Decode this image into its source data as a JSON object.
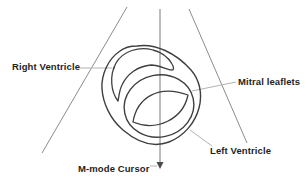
{
  "diagram": {
    "type": "echocardiography-schematic",
    "labels": {
      "right_ventricle": "Right Ventricle",
      "mitral_leaflets": "Mitral leaflets",
      "left_ventricle": "Left Ventricle",
      "m_mode_cursor": "M-mode Cursor"
    },
    "colors": {
      "background": "#ffffff",
      "heart_outline": "#3f3f3f",
      "beam_line": "#8c8c8c",
      "cursor_line": "#7a7a7a",
      "leader_line": "#b3b3b3",
      "leader_dot": "#9a9a9a",
      "arrowhead": "#4a4a4a",
      "label_text": "#1f1f1f"
    }
  }
}
